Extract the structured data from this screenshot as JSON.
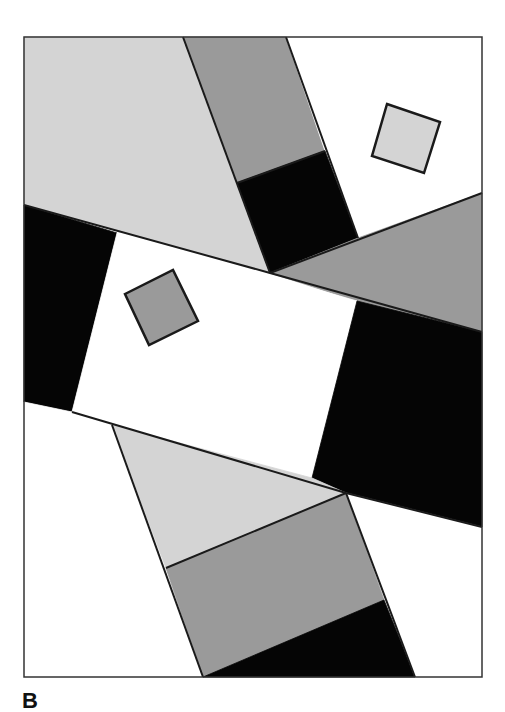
{
  "panel_label": "B",
  "colors": {
    "frame_stroke": "#333333",
    "edge_stroke": "#1a1a1a",
    "white": "#ffffff",
    "light_gray": "#d4d4d4",
    "mid_gray": "#9a9a9a",
    "black": "#050505"
  },
  "frame": {
    "x": 24,
    "y": 37,
    "width": 458,
    "height": 640
  },
  "regions": [
    {
      "name": "light-gray-top-left",
      "fill": "light_gray",
      "points": "24,37 183,37 270,273 24,205"
    },
    {
      "name": "mid-gray-top-strip",
      "fill": "mid_gray",
      "points": "183,37 286,37 325,151 237,183"
    },
    {
      "name": "white-top-right",
      "fill": "white",
      "points": "286,37 482,37 482,193 358,238 325,151"
    },
    {
      "name": "black-top-square",
      "fill": "black",
      "points": "237,183 325,151 358,238 270,273"
    },
    {
      "name": "mid-gray-right-triangle",
      "fill": "mid_gray",
      "points": "270,273 358,238 482,193 482,332 357,301"
    },
    {
      "name": "black-left-band",
      "fill": "black",
      "points": "24,205 117,233 72,412 24,402"
    },
    {
      "name": "white-center-rect",
      "fill": "white",
      "points": "117,233 357,301 312,478 72,412"
    },
    {
      "name": "black-right-band",
      "fill": "black",
      "points": "357,301 482,332 482,527 346,493 312,478"
    },
    {
      "name": "white-bottom-left",
      "fill": "white",
      "points": "24,402 72,412 112,425 203,677 24,677"
    },
    {
      "name": "light-gray-bottom-triangle",
      "fill": "light_gray",
      "points": "112,425 312,478 346,493 166,568"
    },
    {
      "name": "mid-gray-bottom-strip",
      "fill": "mid_gray",
      "points": "166,568 346,493 384,600 203,677"
    },
    {
      "name": "black-bottom-strip",
      "fill": "black",
      "points": "203,677 384,600 415,677"
    },
    {
      "name": "white-bottom-right",
      "fill": "white",
      "points": "346,493 482,527 482,677 415,677"
    }
  ],
  "edges": [
    "24,205 270,273 482,332",
    "72,412 346,493 482,527",
    "183,37 270,273",
    "286,37 358,238",
    "237,183 325,151",
    "270,273 482,193",
    "112,425 203,677",
    "346,493 415,677",
    "166,568 346,493"
  ],
  "squares": [
    {
      "name": "light-gray-small-square",
      "fill": "light_gray",
      "points": "387,104 440,122 424,173 372,156"
    },
    {
      "name": "mid-gray-small-square",
      "fill": "mid_gray",
      "points": "125,294 173,270 198,321 149,345"
    }
  ]
}
